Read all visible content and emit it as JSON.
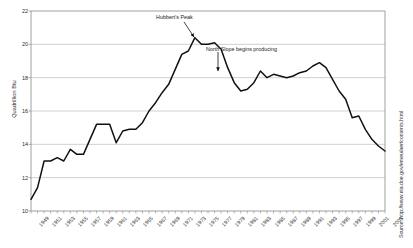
{
  "chart_data": {
    "type": "line",
    "title": "",
    "xlabel": "",
    "ylabel": "Quadrillion Btu",
    "ylim": [
      10,
      22
    ],
    "yticks": [
      10,
      12,
      14,
      16,
      18,
      20,
      22
    ],
    "ytick_labels": [
      "10",
      "12",
      "14",
      "16",
      "18",
      "20",
      "22"
    ],
    "xlim": [
      1949,
      2003
    ],
    "xtick_labels": [
      "1949",
      "1951",
      "1953",
      "1955",
      "1957",
      "1959",
      "1961",
      "1963",
      "1965",
      "1967",
      "1969",
      "1971",
      "1973",
      "1975",
      "1977",
      "1979",
      "1981",
      "1983",
      "1985",
      "1987",
      "1989",
      "1991",
      "1993",
      "1995",
      "1997",
      "1999",
      "2001",
      "2003"
    ],
    "grid": "horizontal",
    "legend": "none",
    "line_color": "#111111",
    "grid_color": "#a8a8a8",
    "axis_color": "#888888",
    "x": [
      1949,
      1950,
      1951,
      1952,
      1953,
      1954,
      1955,
      1956,
      1957,
      1958,
      1959,
      1960,
      1961,
      1962,
      1963,
      1964,
      1965,
      1966,
      1967,
      1968,
      1969,
      1970,
      1971,
      1972,
      1973,
      1974,
      1975,
      1976,
      1977,
      1978,
      1979,
      1980,
      1981,
      1982,
      1983,
      1984,
      1985,
      1986,
      1987,
      1988,
      1989,
      1990,
      1991,
      1992,
      1993,
      1994,
      1995,
      1996,
      1997,
      1998,
      1999,
      2000,
      2001,
      2002,
      2003
    ],
    "y": [
      10.7,
      11.4,
      13.0,
      13.0,
      13.2,
      13.0,
      13.7,
      13.4,
      13.4,
      14.3,
      15.2,
      15.2,
      15.2,
      14.1,
      14.8,
      14.9,
      14.9,
      15.3,
      16.0,
      16.5,
      17.1,
      17.6,
      18.5,
      19.4,
      19.6,
      20.4,
      20.0,
      20.0,
      20.1,
      19.7,
      18.6,
      17.7,
      17.2,
      17.3,
      17.7,
      18.4,
      18.0,
      18.2,
      18.1,
      18.0,
      18.1,
      18.3,
      18.4,
      18.7,
      18.9,
      18.6,
      17.9,
      17.2,
      16.7,
      15.6,
      15.7,
      14.9,
      14.3,
      13.9,
      13.6,
      13.5,
      13.0,
      12.4,
      12.2,
      12.1,
      12.1
    ],
    "annotations": [
      {
        "id": "hubberts-peak",
        "text": "Hubbert's Peak",
        "label_x": 156,
        "label_y": 14,
        "arrow_from_x": 184,
        "arrow_from_y": 22,
        "arrow_to_x": 194,
        "arrow_to_y": 37
      },
      {
        "id": "north-slope",
        "text": "North Slope begins producing",
        "label_x": 206,
        "label_y": 46,
        "arrow_from_x": 218,
        "arrow_from_y": 52,
        "arrow_to_x": 218,
        "arrow_to_y": 71
      }
    ],
    "source": "Source: http://www.eia.doe.gov/emeu/aer/contents.html"
  }
}
